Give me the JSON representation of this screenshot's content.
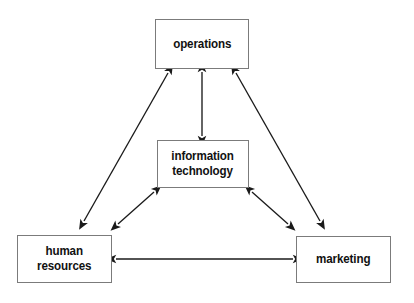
{
  "diagram": {
    "type": "relationship-triangle",
    "background_color": "#ffffff",
    "line_color": "#1a1a1a",
    "box_border_color": "#7b7b7b",
    "text_color": "#111111",
    "nodes": [
      {
        "id": "operations",
        "label": "operations",
        "position": "top-center"
      },
      {
        "id": "information-technology",
        "label": "information\ntechnology",
        "position": "center"
      },
      {
        "id": "human-resources",
        "label": "human\nresources",
        "position": "bottom-left"
      },
      {
        "id": "marketing",
        "label": "marketing",
        "position": "bottom-right"
      }
    ],
    "edges": [
      {
        "id": "operations-information-technology",
        "from": "operations",
        "to": "information-technology",
        "direction": "bidirectional",
        "orientation": "vertical"
      },
      {
        "id": "operations-human-resources",
        "from": "operations",
        "to": "human-resources",
        "direction": "bidirectional",
        "orientation": "diagonal"
      },
      {
        "id": "operations-marketing",
        "from": "operations",
        "to": "marketing",
        "direction": "bidirectional",
        "orientation": "diagonal"
      },
      {
        "id": "information-technology-human-resources",
        "from": "information-technology",
        "to": "human-resources",
        "direction": "bidirectional",
        "orientation": "diagonal"
      },
      {
        "id": "information-technology-marketing",
        "from": "information-technology",
        "to": "marketing",
        "direction": "bidirectional",
        "orientation": "diagonal"
      },
      {
        "id": "human-resources-marketing",
        "from": "human-resources",
        "to": "marketing",
        "direction": "bidirectional",
        "orientation": "horizontal"
      }
    ]
  }
}
